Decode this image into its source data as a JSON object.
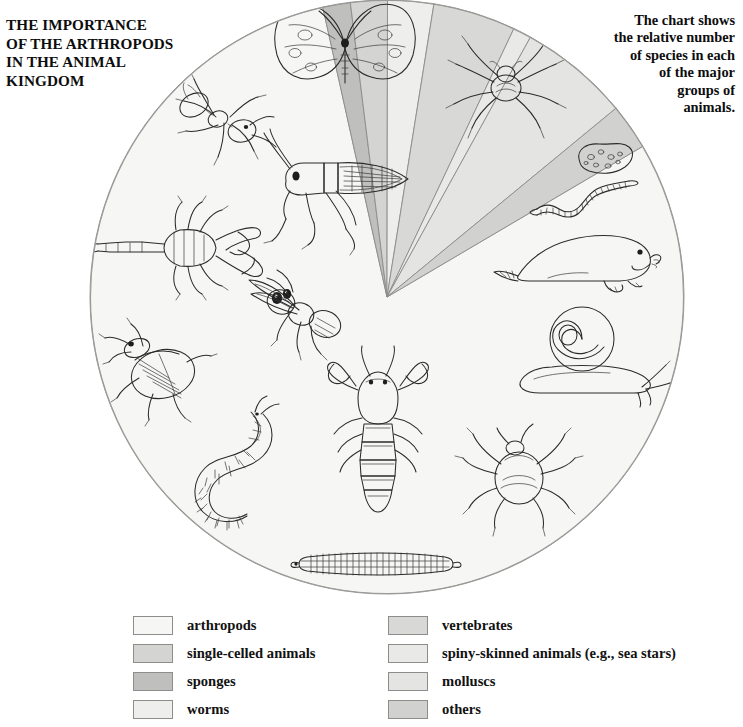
{
  "title": {
    "lines": [
      "THE IMPORTANCE",
      "OF THE ARTHROPODS",
      "IN THE ANIMAL",
      "KINGDOM"
    ]
  },
  "caption": {
    "lines": [
      "The chart shows",
      "the relative number",
      "of species in each",
      "of the major",
      "groups of",
      "animals."
    ]
  },
  "legend": {
    "left_column": [
      {
        "label": "arthropods",
        "color": "#f6f6f4"
      },
      {
        "label": "single-celled animals",
        "color": "#d4d4d2"
      },
      {
        "label": "sponges",
        "color": "#bfbfbd"
      },
      {
        "label": "worms",
        "color": "#eeeeec"
      }
    ],
    "right_column": [
      {
        "label": "vertebrates",
        "color": "#d8d8d6"
      },
      {
        "label": "spiny-skinned animals (e.g., sea stars)",
        "color": "#e9e9e7"
      },
      {
        "label": "molluscs",
        "color": "#e4e4e2"
      },
      {
        "label": "others",
        "color": "#d1d1cf"
      }
    ]
  },
  "chart_data": {
    "type": "pie",
    "title": "THE IMPORTANCE OF THE ARTHROPODS IN THE ANIMAL KINGDOM",
    "subtitle": "The chart shows the relative number of species in each of the major groups of animals.",
    "units": "percent of known animal species",
    "center_px": [
      387,
      297
    ],
    "radius_px": 297,
    "start_angle_deg": -30.5,
    "direction": "clockwise",
    "legend_position": "bottom",
    "categories": [
      "arthropods",
      "sponges",
      "single-celled animals",
      "worms",
      "vertebrates",
      "spiny-skinned animals (e.g., sea stars)",
      "molluscs",
      "others"
    ],
    "values": [
      80.0,
      1.5,
      2.0,
      2.5,
      4.5,
      1.0,
      6.0,
      2.5
    ],
    "colors": [
      "#f6f6f4",
      "#bfbfbd",
      "#d4d4d2",
      "#eeeeec",
      "#d8d8d6",
      "#e9e9e7",
      "#e4e4e2",
      "#d1d1cf"
    ],
    "slice_illustrations": {
      "arthropods": [
        "butterfly",
        "tarantula",
        "ant",
        "grasshopper",
        "scorpion",
        "fly",
        "beetle",
        "centipede",
        "lobster",
        "tick",
        "millipede"
      ],
      "sponges": [
        "sponge"
      ],
      "single-celled animals": [],
      "worms": [
        "earthworm"
      ],
      "vertebrates": [
        "seal"
      ],
      "spiny-skinned animals (e.g., sea stars)": [],
      "molluscs": [
        "snail"
      ],
      "others": []
    }
  }
}
